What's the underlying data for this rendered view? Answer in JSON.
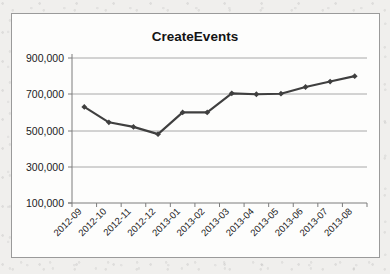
{
  "chart_data": {
    "type": "line",
    "title": "CreateEvents",
    "subtitle": "",
    "xlabel": "",
    "ylabel": "",
    "categories": [
      "2012-09",
      "2012-10",
      "2012-11",
      "2012-12",
      "2013-01",
      "2013-02",
      "2013-03",
      "2013-04",
      "2013-05",
      "2013-06",
      "2013-07",
      "2013-08"
    ],
    "values": [
      630000,
      545000,
      520000,
      480000,
      600000,
      600000,
      705000,
      700000,
      703000,
      740000,
      770000,
      800000
    ],
    "series": [
      {
        "name": "CreateEvents",
        "values": [
          630000,
          545000,
          520000,
          480000,
          600000,
          600000,
          705000,
          700000,
          703000,
          740000,
          770000,
          800000
        ]
      }
    ],
    "ylim": [
      100000,
      900000
    ],
    "ytick_labels": [
      "100,000",
      "300,000",
      "500,000",
      "700,000",
      "900,000"
    ],
    "ytick_values": [
      100000,
      300000,
      700000,
      500000,
      900000
    ],
    "ytick_step": 200000,
    "grid": "horizontal",
    "legend": "none",
    "legend_position": "none",
    "marker": "diamond",
    "line_color": "#3f3f3f",
    "marker_color": "#3f3f3f",
    "grid_color": "#a8a8a8",
    "axis_color": "#7d7d7d",
    "plot_background": "#fdfdfc",
    "frame_border_color": "#9a9a9a",
    "xtick_label_rotation": -45
  }
}
